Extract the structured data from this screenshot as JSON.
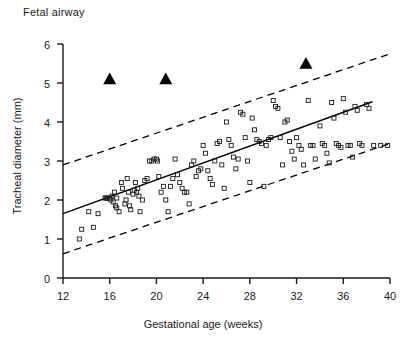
{
  "figure": {
    "title": "Fetal airway",
    "background": "#ffffff",
    "ink_color": "#1a1a1a"
  },
  "chart_data": {
    "type": "scatter",
    "title": "Fetal airway",
    "xlabel": "Gestational age (weeks)",
    "ylabel": "Tracheal diameter (mm)",
    "xlim": [
      12,
      40
    ],
    "ylim": [
      0,
      6
    ],
    "xticks": [
      12,
      16,
      20,
      24,
      28,
      32,
      36,
      40
    ],
    "yticks": [
      0,
      1,
      2,
      3,
      4,
      5,
      6
    ],
    "grid": false,
    "legend": null,
    "series": [
      {
        "name": "Normal fetuses",
        "marker": "open-square",
        "color": "#1a1a1a",
        "points": [
          [
            13.4,
            1.0
          ],
          [
            13.6,
            1.25
          ],
          [
            14.6,
            1.3
          ],
          [
            14.2,
            1.7
          ],
          [
            15.0,
            1.65
          ],
          [
            15.6,
            2.05
          ],
          [
            15.7,
            2.05
          ],
          [
            15.8,
            2.05
          ],
          [
            16.0,
            2.05
          ],
          [
            16.1,
            2.0
          ],
          [
            16.2,
            2.1
          ],
          [
            16.3,
            1.95
          ],
          [
            16.4,
            2.2
          ],
          [
            16.5,
            1.85
          ],
          [
            16.6,
            1.8
          ],
          [
            16.6,
            2.05
          ],
          [
            16.8,
            1.7
          ],
          [
            17.0,
            2.45
          ],
          [
            17.1,
            2.3
          ],
          [
            17.3,
            1.9
          ],
          [
            17.4,
            2.0
          ],
          [
            17.5,
            2.55
          ],
          [
            17.6,
            2.2
          ],
          [
            17.7,
            1.85
          ],
          [
            17.8,
            1.75
          ],
          [
            18.0,
            2.15
          ],
          [
            18.1,
            2.25
          ],
          [
            18.2,
            2.45
          ],
          [
            18.3,
            2.2
          ],
          [
            18.4,
            2.3
          ],
          [
            18.5,
            2.1
          ],
          [
            18.6,
            1.7
          ],
          [
            18.8,
            2.0
          ],
          [
            19.0,
            2.5
          ],
          [
            19.2,
            2.55
          ],
          [
            19.4,
            3.0
          ],
          [
            19.6,
            3.0
          ],
          [
            19.8,
            3.05
          ],
          [
            20.0,
            3.05
          ],
          [
            20.1,
            3.0
          ],
          [
            20.2,
            2.6
          ],
          [
            20.4,
            2.2
          ],
          [
            20.6,
            2.35
          ],
          [
            20.8,
            2.0
          ],
          [
            21.0,
            1.7
          ],
          [
            21.2,
            2.35
          ],
          [
            21.4,
            2.55
          ],
          [
            21.6,
            3.05
          ],
          [
            21.8,
            2.65
          ],
          [
            22.0,
            2.45
          ],
          [
            22.2,
            2.3
          ],
          [
            22.4,
            2.2
          ],
          [
            22.6,
            2.2
          ],
          [
            22.8,
            1.9
          ],
          [
            23.0,
            2.9
          ],
          [
            23.2,
            3.0
          ],
          [
            23.4,
            2.6
          ],
          [
            23.6,
            2.75
          ],
          [
            23.8,
            2.8
          ],
          [
            24.0,
            3.4
          ],
          [
            24.2,
            3.2
          ],
          [
            24.4,
            2.75
          ],
          [
            24.6,
            2.55
          ],
          [
            24.8,
            2.4
          ],
          [
            25.0,
            3.0
          ],
          [
            25.2,
            3.45
          ],
          [
            25.4,
            3.5
          ],
          [
            25.6,
            2.9
          ],
          [
            25.8,
            2.3
          ],
          [
            26.0,
            4.0
          ],
          [
            26.2,
            3.55
          ],
          [
            26.4,
            3.4
          ],
          [
            26.6,
            3.1
          ],
          [
            26.8,
            2.8
          ],
          [
            27.0,
            3.05
          ],
          [
            27.2,
            4.25
          ],
          [
            27.4,
            4.2
          ],
          [
            27.6,
            3.6
          ],
          [
            27.8,
            3.0
          ],
          [
            28.0,
            2.45
          ],
          [
            28.2,
            4.1
          ],
          [
            28.4,
            3.8
          ],
          [
            28.6,
            3.55
          ],
          [
            28.8,
            3.5
          ],
          [
            29.0,
            3.45
          ],
          [
            29.2,
            2.35
          ],
          [
            29.4,
            3.4
          ],
          [
            29.6,
            3.55
          ],
          [
            29.8,
            3.6
          ],
          [
            30.0,
            4.55
          ],
          [
            30.2,
            4.4
          ],
          [
            30.4,
            4.35
          ],
          [
            30.6,
            3.6
          ],
          [
            30.8,
            2.9
          ],
          [
            31.0,
            4.0
          ],
          [
            31.2,
            4.05
          ],
          [
            31.4,
            3.5
          ],
          [
            31.6,
            3.25
          ],
          [
            31.8,
            3.05
          ],
          [
            32.0,
            3.6
          ],
          [
            32.2,
            3.4
          ],
          [
            32.4,
            3.3
          ],
          [
            32.6,
            2.9
          ],
          [
            33.0,
            4.55
          ],
          [
            33.2,
            3.4
          ],
          [
            33.4,
            3.4
          ],
          [
            33.6,
            3.05
          ],
          [
            34.0,
            3.9
          ],
          [
            34.2,
            3.45
          ],
          [
            34.4,
            3.4
          ],
          [
            34.6,
            3.2
          ],
          [
            34.8,
            2.95
          ],
          [
            35.0,
            4.5
          ],
          [
            35.2,
            4.1
          ],
          [
            35.4,
            3.45
          ],
          [
            35.6,
            3.4
          ],
          [
            35.8,
            3.35
          ],
          [
            36.0,
            4.6
          ],
          [
            36.2,
            4.25
          ],
          [
            36.4,
            3.4
          ],
          [
            36.6,
            3.4
          ],
          [
            36.8,
            3.1
          ],
          [
            37.0,
            4.4
          ],
          [
            37.2,
            4.3
          ],
          [
            37.4,
            3.45
          ],
          [
            37.6,
            3.4
          ],
          [
            38.0,
            4.45
          ],
          [
            38.2,
            4.35
          ],
          [
            38.6,
            3.4
          ],
          [
            39.2,
            3.4
          ],
          [
            39.8,
            3.4
          ]
        ]
      },
      {
        "name": "Abnormal / obstructed airway cases",
        "marker": "filled-triangle",
        "color": "#000000",
        "points": [
          [
            16.0,
            5.1
          ],
          [
            20.8,
            5.1
          ],
          [
            32.8,
            5.5
          ]
        ]
      }
    ],
    "lines": [
      {
        "name": "Regression line",
        "style": "solid",
        "color": "#000000",
        "x": [
          12.0,
          38.5
        ],
        "y": [
          1.65,
          4.52
        ]
      },
      {
        "name": "Upper prediction limit",
        "style": "dashed",
        "color": "#000000",
        "x": [
          12.0,
          40.0
        ],
        "y": [
          2.9,
          5.75
        ]
      },
      {
        "name": "Lower prediction limit",
        "style": "dashed",
        "color": "#000000",
        "x": [
          12.0,
          40.0
        ],
        "y": [
          0.62,
          3.45
        ]
      }
    ]
  }
}
